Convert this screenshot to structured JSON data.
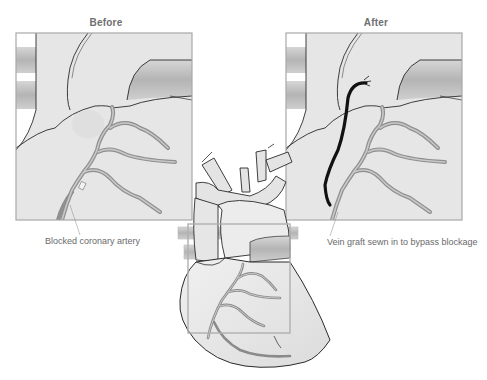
{
  "figure": {
    "panels": [
      {
        "id": "before",
        "label": "Before",
        "caption": "Blocked coronary artery"
      },
      {
        "id": "after",
        "label": "After",
        "caption": "Vein graft sewn in to bypass blockage"
      }
    ],
    "center": {
      "label": "Heart with highlighted region"
    },
    "colors": {
      "outline": "#2a2a2a",
      "heart_fill": "#e8e8e8",
      "vessel_fill": "#bdbdbd",
      "artery": "#9a9a9a",
      "graft": "#111111",
      "frame": "#a8a8a8",
      "text": "#6a6a6a"
    }
  }
}
